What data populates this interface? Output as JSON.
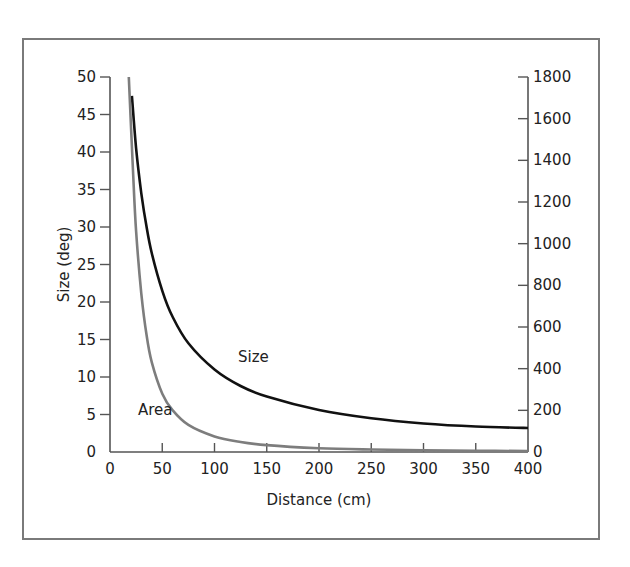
{
  "chart_data": {
    "type": "line",
    "title": "",
    "xlabel": "Distance (cm)",
    "ylabel": "Size (deg)",
    "y2label": "",
    "xlim": [
      0,
      400
    ],
    "ylim": [
      0,
      50
    ],
    "y2lim": [
      0,
      1800
    ],
    "xticks": [
      0,
      50,
      100,
      150,
      200,
      250,
      300,
      350,
      400
    ],
    "yticks": [
      0,
      5,
      10,
      15,
      20,
      25,
      30,
      35,
      40,
      45,
      50
    ],
    "y2ticks": [
      0,
      200,
      400,
      600,
      800,
      1000,
      1200,
      1400,
      1600,
      1800
    ],
    "grid": false,
    "series": [
      {
        "name": "Size",
        "axis": "left",
        "color": "#111111",
        "x": [
          21,
          25,
          30,
          35,
          40,
          50,
          60,
          75,
          100,
          125,
          150,
          200,
          250,
          300,
          350,
          400
        ],
        "y": [
          47.5,
          40.5,
          34.5,
          30.0,
          26.5,
          21.5,
          18.0,
          14.5,
          11.0,
          8.8,
          7.4,
          5.6,
          4.5,
          3.8,
          3.4,
          3.2
        ]
      },
      {
        "name": "Area",
        "axis": "right",
        "color": "#7d7d7d",
        "x": [
          18,
          22,
          25,
          30,
          35,
          40,
          50,
          60,
          75,
          100,
          125,
          150,
          200,
          250,
          300,
          350,
          400
        ],
        "y": [
          1800,
          1350,
          1060,
          760,
          560,
          430,
          280,
          200,
          130,
          75,
          48,
          33,
          18,
          12,
          8,
          6,
          5
        ]
      }
    ],
    "annotations": [
      {
        "text": "Size",
        "x": 150,
        "y": 11
      },
      {
        "text": "Area",
        "x": 45,
        "y": 4.5
      }
    ]
  }
}
